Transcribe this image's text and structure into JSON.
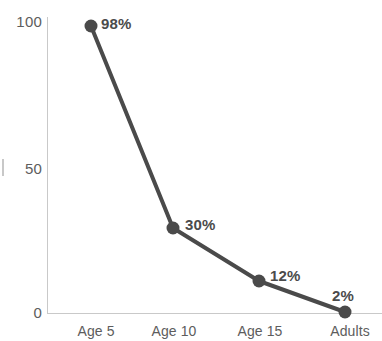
{
  "chart_data": {
    "type": "line",
    "title": "",
    "subtitle": "",
    "xlabel": "",
    "ylabel": "",
    "categories": [
      "Age 5",
      "Age 10",
      "Age 15",
      "Adults"
    ],
    "values": [
      98,
      30,
      12,
      2
    ],
    "point_labels": [
      "98%",
      "30%",
      "12%",
      "2%"
    ],
    "series": [
      {
        "name": "",
        "values": [
          98,
          30,
          12,
          2
        ]
      }
    ],
    "ylim": [
      0,
      100
    ],
    "y_ticks": [
      0,
      50,
      100
    ],
    "y_tick_labels": [
      "0",
      "50",
      "100"
    ],
    "grid": false,
    "legend": false,
    "legend_position": "none",
    "marker": "filled-circle",
    "colors": {
      "line": "#4a4a4a",
      "marker": "#4a4a4a",
      "label_text": "#4b4b4b",
      "tick_text": "#5d5d5d",
      "axis": "#c9c9c9",
      "background": "#ffffff"
    }
  },
  "axes": {
    "y_ticks": [
      {
        "label": "100",
        "top": 14
      },
      {
        "label": "50",
        "top": 161
      },
      {
        "label": "0",
        "top": 305
      }
    ],
    "x_ticks": [
      {
        "label": "Age 5",
        "left": 96
      },
      {
        "label": "Age 10",
        "left": 174
      },
      {
        "label": "Age 15",
        "left": 260
      },
      {
        "label": "Adults",
        "left": 350
      }
    ]
  },
  "points": [
    {
      "label": "98%",
      "cx": 91,
      "cy": 26,
      "label_left": 101,
      "label_top": 16
    },
    {
      "label": "30%",
      "cx": 173,
      "cy": 228,
      "label_left": 185,
      "label_top": 217
    },
    {
      "label": "12%",
      "cx": 259,
      "cy": 281,
      "label_left": 270,
      "label_top": 268
    },
    {
      "label": "2%",
      "cx": 345,
      "cy": 312,
      "label_left": 332,
      "label_top": 288
    }
  ]
}
